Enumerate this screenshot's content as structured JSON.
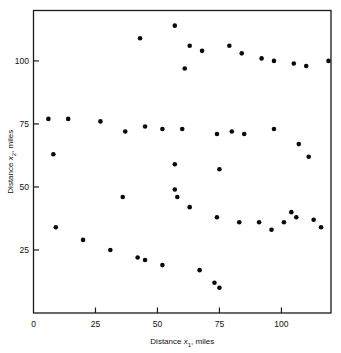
{
  "chart_data": {
    "type": "scatter",
    "title": "",
    "xlabel": "Distance x 1, miles",
    "ylabel": "Distance x 2, miles",
    "xlabel_parts": {
      "prefix": "Distance ",
      "symbol": "x",
      "sub": "1",
      "suffix": ", miles"
    },
    "ylabel_parts": {
      "prefix": "Distance ",
      "symbol": "x",
      "sub": "2",
      "suffix": ", miles"
    },
    "xlim": [
      0,
      120
    ],
    "ylim": [
      0,
      120
    ],
    "xticks": [
      0,
      25,
      50,
      75,
      100
    ],
    "yticks": [
      25,
      50,
      75,
      100
    ],
    "xticklabels": [
      "0",
      "25",
      "50",
      "75",
      "100"
    ],
    "yticklabels": [
      "25",
      "50",
      "75",
      "100"
    ],
    "grid": false,
    "legend": false,
    "marker": "filled-circle",
    "marker_color": "#0a0a0a",
    "marker_size_px": 4.6,
    "n_points": 49,
    "points": [
      [
        6,
        77
      ],
      [
        8,
        63
      ],
      [
        9,
        34
      ],
      [
        14,
        77
      ],
      [
        20,
        29
      ],
      [
        27,
        76
      ],
      [
        31,
        25
      ],
      [
        36,
        46
      ],
      [
        37,
        72
      ],
      [
        42,
        22
      ],
      [
        43,
        109
      ],
      [
        45,
        74
      ],
      [
        45,
        21
      ],
      [
        52,
        19
      ],
      [
        52,
        73
      ],
      [
        57,
        114
      ],
      [
        57,
        59
      ],
      [
        57,
        49
      ],
      [
        58,
        46
      ],
      [
        60,
        73
      ],
      [
        61,
        97
      ],
      [
        63,
        106
      ],
      [
        63,
        42
      ],
      [
        67,
        17
      ],
      [
        68,
        104
      ],
      [
        73,
        12
      ],
      [
        74,
        71
      ],
      [
        74,
        38
      ],
      [
        75,
        10
      ],
      [
        75,
        57
      ],
      [
        79,
        106
      ],
      [
        80,
        72
      ],
      [
        83,
        36
      ],
      [
        84,
        103
      ],
      [
        85,
        71
      ],
      [
        91,
        36
      ],
      [
        92,
        101
      ],
      [
        96,
        33
      ],
      [
        97,
        100
      ],
      [
        97,
        73
      ],
      [
        101,
        36
      ],
      [
        104,
        40
      ],
      [
        105,
        99
      ],
      [
        106,
        38
      ],
      [
        107,
        67
      ],
      [
        110,
        98
      ],
      [
        111,
        62
      ],
      [
        113,
        37
      ],
      [
        116,
        34
      ],
      [
        119,
        100
      ]
    ]
  }
}
